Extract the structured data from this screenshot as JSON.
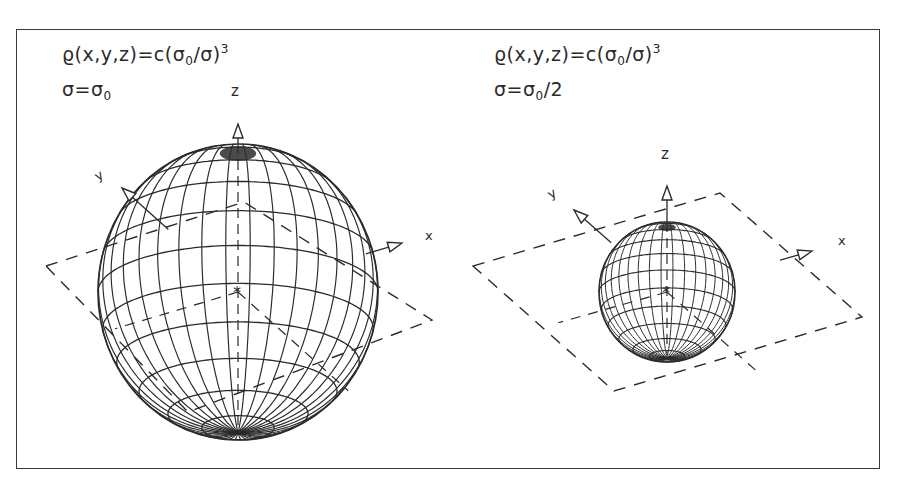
{
  "panels": [
    {
      "id": "left",
      "formula": {
        "lhs": "ϱ(x,y,z)=c(σ",
        "sub0": "0",
        "mid": "/σ)",
        "sup": "3"
      },
      "condition": {
        "lhs": "σ=σ",
        "sub": "0",
        "rhs": ""
      },
      "axis_labels": {
        "x": "x",
        "y": "y",
        "z": "z"
      },
      "sphere": {
        "cx": 238,
        "cy": 292,
        "rx": 140,
        "ry": 148,
        "tilt": 0.32,
        "meridians": 36,
        "parallels": 12
      },
      "plane": [
        [
          46,
          266
        ],
        [
          244,
          202
        ],
        [
          432,
          320
        ],
        [
          188,
          412
        ]
      ],
      "axes": {
        "origin": [
          238,
          292
        ],
        "z_tip": [
          238,
          124
        ],
        "x_tip": [
          402,
          243
        ],
        "y_tip": [
          122,
          188
        ]
      }
    },
    {
      "id": "right",
      "formula": {
        "lhs": "ϱ(x,y,z)=c(σ",
        "sub0": "0",
        "mid": "/σ)",
        "sup": "3"
      },
      "condition": {
        "lhs": "σ=σ",
        "sub": "0",
        "rhs": "/2"
      },
      "axis_labels": {
        "x": "x",
        "y": "y",
        "z": "z"
      },
      "sphere": {
        "cx": 667,
        "cy": 292,
        "rx": 68,
        "ry": 70,
        "tilt": 0.32,
        "meridians": 36,
        "parallels": 12
      },
      "plane": [
        [
          473,
          266
        ],
        [
          720,
          193
        ],
        [
          862,
          317
        ],
        [
          614,
          391
        ]
      ],
      "axes": {
        "origin": [
          667,
          292
        ],
        "z_tip": [
          667,
          186
        ],
        "x_tip": [
          812,
          251
        ],
        "y_tip": [
          574,
          210
        ]
      }
    }
  ],
  "colors": {
    "ink": "#2b2b2b",
    "frame": "#3a3a3a",
    "background": "#ffffff"
  }
}
